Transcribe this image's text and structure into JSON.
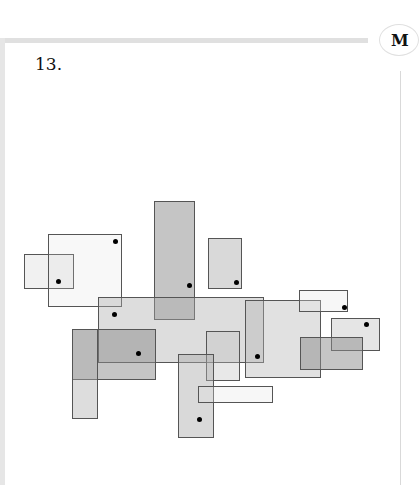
{
  "page": {
    "problem_number": "13.",
    "margin_badge": "M"
  },
  "figure": {
    "rectangles": [
      {
        "id": "r1",
        "x": 24,
        "y": 254,
        "w": 50,
        "h": 35,
        "fill": "rgba(200,200,200,0.25)"
      },
      {
        "id": "r2",
        "x": 48,
        "y": 234,
        "w": 74,
        "h": 73,
        "fill": "rgba(220,220,220,0.2)"
      },
      {
        "id": "r3",
        "x": 154,
        "y": 201,
        "w": 41,
        "h": 119,
        "fill": "rgba(150,150,150,0.55)"
      },
      {
        "id": "r4",
        "x": 208,
        "y": 238,
        "w": 34,
        "h": 51,
        "fill": "rgba(170,170,170,0.45)"
      },
      {
        "id": "r5",
        "x": 98,
        "y": 297,
        "w": 166,
        "h": 66,
        "fill": "rgba(170,170,170,0.4)"
      },
      {
        "id": "r6",
        "x": 72,
        "y": 329,
        "w": 84,
        "h": 51,
        "fill": "rgba(140,140,140,0.5)"
      },
      {
        "id": "r7",
        "x": 72,
        "y": 329,
        "w": 26,
        "h": 90,
        "fill": "rgba(170,170,170,0.4)"
      },
      {
        "id": "r8",
        "x": 245,
        "y": 300,
        "w": 76,
        "h": 78,
        "fill": "rgba(180,180,180,0.4)"
      },
      {
        "id": "r9",
        "x": 299,
        "y": 290,
        "w": 49,
        "h": 22,
        "fill": "rgba(230,230,230,0.3)"
      },
      {
        "id": "r10",
        "x": 331,
        "y": 318,
        "w": 49,
        "h": 33,
        "fill": "rgba(190,190,190,0.4)"
      },
      {
        "id": "r11",
        "x": 300,
        "y": 337,
        "w": 63,
        "h": 33,
        "fill": "rgba(140,140,140,0.5)"
      },
      {
        "id": "r12",
        "x": 206,
        "y": 331,
        "w": 34,
        "h": 50,
        "fill": "rgba(190,190,190,0.35)"
      },
      {
        "id": "r13",
        "x": 178,
        "y": 354,
        "w": 36,
        "h": 84,
        "fill": "rgba(170,170,170,0.45)"
      },
      {
        "id": "r14",
        "x": 198,
        "y": 386,
        "w": 75,
        "h": 17,
        "fill": "rgba(230,230,230,0.3)"
      }
    ],
    "dots": [
      {
        "x": 58,
        "y": 281
      },
      {
        "x": 115,
        "y": 241
      },
      {
        "x": 189,
        "y": 285
      },
      {
        "x": 236,
        "y": 282
      },
      {
        "x": 114,
        "y": 314
      },
      {
        "x": 138,
        "y": 353
      },
      {
        "x": 257,
        "y": 356
      },
      {
        "x": 344,
        "y": 307
      },
      {
        "x": 366,
        "y": 324
      },
      {
        "x": 199,
        "y": 419
      }
    ]
  }
}
